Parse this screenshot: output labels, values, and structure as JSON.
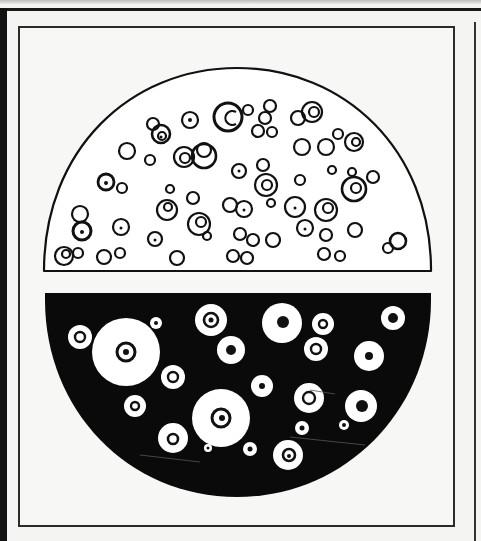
{
  "figure": {
    "colors": {
      "paper": "#f4f4f2",
      "ink": "#111111",
      "halo": "#ffffff"
    },
    "top_panel": {
      "label": "bright-field-view",
      "background": "#ffffff"
    },
    "bottom_panel": {
      "label": "dark-field-view",
      "background": "#0a0a0a"
    }
  }
}
